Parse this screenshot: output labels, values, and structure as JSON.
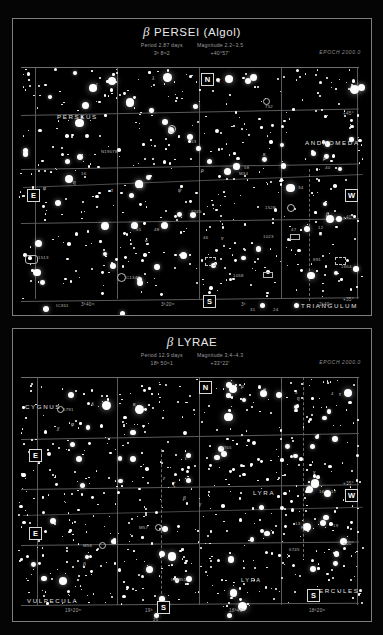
{
  "page": {
    "background": "#000000",
    "star_color": "#ffffff",
    "grid_color": "#5a5a5a"
  },
  "charts": [
    {
      "id": "beta-persei",
      "title_greek": "β",
      "title": "PERSEI (Algol)",
      "period": "Period 2.87 days",
      "ra": "3ʰ 8ᵐ2",
      "magnitude": "Magnitude 2.2–3.5",
      "dec": "+40°57′",
      "epoch": "EPOCH 2000.0",
      "constellations": [
        "PERSEUS",
        "ANDROMEDA",
        "TRIANGULUM"
      ],
      "compass": {
        "north": "N",
        "south": "S",
        "east": "E",
        "west": "W"
      },
      "ra_ticks": [
        "3ʰ40ᵐ",
        "3ʰ20ᵐ",
        "3ʰ",
        "2ʰ40ᵐ"
      ],
      "dec_ticks": [
        "+45°",
        "+40°",
        "+35°"
      ],
      "star_labels": [
        "53",
        "58",
        "β",
        "λ",
        "ι",
        "φ",
        "χ",
        "η",
        "ρ",
        "π",
        "κ",
        "ν",
        "ε",
        "51",
        "48",
        "47",
        "46",
        "42",
        "40",
        "38",
        "34",
        "31",
        "24",
        "16",
        "12"
      ],
      "dso_labels": [
        "N1907B",
        "M34",
        "IC351",
        "C1342",
        "IC351",
        "1058",
        "1023",
        "891",
        "1245",
        "1528",
        "1582",
        "1513",
        "1664",
        "752"
      ]
    },
    {
      "id": "beta-lyrae",
      "title_greek": "β",
      "title": "LYRAE",
      "period": "Period 12.9 days",
      "ra": "18ʰ 50ᵐ1",
      "magnitude": "Magnitude 3.4–4.3",
      "dec": "+33°22′",
      "epoch": "EPOCH 2000.0",
      "constellations": [
        "CYGNUS",
        "LYRA",
        "VULPECULA",
        "HERCULES"
      ],
      "compass": {
        "north": "N",
        "south": "S",
        "east": "E",
        "west": "W"
      },
      "ra_ticks": [
        "19ʰ20ᵐ",
        "19ʰ",
        "18ʰ40ᵐ",
        "18ʰ20ᵐ"
      ],
      "dec_ticks": [
        "+35°",
        "+30°"
      ],
      "star_labels": [
        "β",
        "γ",
        "δ",
        "ζ",
        "η",
        "θ",
        "κ",
        "λ",
        "ι",
        "μ",
        "ε",
        "R",
        "16",
        "17",
        "19",
        "21",
        "4",
        "13",
        "χ",
        "φ",
        "1",
        "2"
      ],
      "dso_labels": [
        "M56",
        "M57",
        "IC4951",
        "6791",
        "6765",
        "6745",
        "NGC6791"
      ]
    }
  ]
}
